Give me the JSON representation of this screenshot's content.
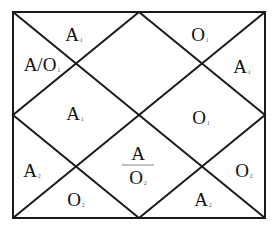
{
  "diagram": {
    "frame": {
      "x1": 13,
      "y1": 12,
      "x2": 265,
      "y2": 218
    },
    "line_color": "#1a1a1a",
    "regions": [
      {
        "id": "top-left",
        "base": "A",
        "sub": "1",
        "x": 74,
        "y": 34
      },
      {
        "id": "top-right",
        "base": "O",
        "sub": "1",
        "x": 200,
        "y": 34
      },
      {
        "id": "left-upper",
        "base": "A/O",
        "sub": "1",
        "x": 42,
        "y": 64
      },
      {
        "id": "right-upper",
        "base": "A",
        "sub": "1",
        "x": 242,
        "y": 66
      },
      {
        "id": "mid-left",
        "base": "A",
        "sub": "1",
        "x": 75,
        "y": 113
      },
      {
        "id": "mid-right",
        "base": "O",
        "sub": "1",
        "x": 201,
        "y": 117
      },
      {
        "id": "left-lower",
        "base": "A",
        "sub": "2",
        "x": 32,
        "y": 170
      },
      {
        "id": "right-lower",
        "base": "O",
        "sub": "2",
        "x": 244,
        "y": 170
      },
      {
        "id": "bottom-left",
        "base": "O",
        "sub": "2",
        "x": 76,
        "y": 199
      },
      {
        "id": "bottom-right",
        "base": "A",
        "sub": "2",
        "x": 203,
        "y": 199
      }
    ],
    "center_fraction": {
      "numerator": "A",
      "denominator": "O",
      "sub": "2",
      "x": 138,
      "y": 165
    }
  }
}
